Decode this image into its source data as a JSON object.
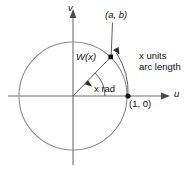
{
  "figure": {
    "axes": {
      "vertical_label": "v",
      "horizontal_label": "u"
    },
    "labels": {
      "point_coords": "(a, b)",
      "wrapping_function": "W(x)",
      "angle": "x rad",
      "arc_line1": "x units",
      "arc_line2": "arc length",
      "unit_point": "(1, 0)"
    },
    "colors": {
      "circle": "#8c8c8c",
      "axis": "#6e6e6e",
      "ink": "#4a4a4a",
      "text": "#111111",
      "background": "#ffffff"
    },
    "geometry": {
      "center_x": 73,
      "center_y": 96,
      "radius": 54,
      "angle_deg": 46,
      "outer_arc_radius": 72
    }
  }
}
